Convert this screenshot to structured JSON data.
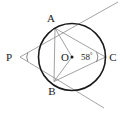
{
  "figure": {
    "type": "circle-tangent-geometry-diagram",
    "background_color": "#ffffff",
    "circle_stroke_color": "#1a1a1a",
    "chord_stroke_color": "#8a8a8a",
    "tangent_stroke_color": "#9a9a9a",
    "label_color": "#1a1a1a"
  },
  "labels": {
    "center": "O",
    "point_a": "A",
    "point_b": "B",
    "point_c": "C",
    "point_p": "P",
    "angle_value": "58",
    "degree_symbol": "°"
  },
  "chart_data": {
    "type": "scatter",
    "title": "",
    "xlabel": "",
    "ylabel": "",
    "xlim": [
      0,
      123
    ],
    "ylim": [
      0,
      114
    ],
    "grid": false,
    "legend": null,
    "circle": {
      "cx": 72,
      "cy": 57,
      "r": 33.5
    },
    "points": [
      {
        "name": "O",
        "x": 72,
        "y": 57,
        "on_circle": false,
        "marker": "dot"
      },
      {
        "name": "A",
        "x": 55.0,
        "y": 28.2,
        "on_circle": true,
        "marker": "none"
      },
      {
        "name": "B",
        "x": 54.0,
        "y": 81.5,
        "on_circle": true,
        "marker": "none"
      },
      {
        "name": "C",
        "x": 105.5,
        "y": 57.0,
        "on_circle": true,
        "marker": "none"
      },
      {
        "name": "P",
        "x": 20.0,
        "y": 57.0,
        "on_circle": false,
        "marker": "none"
      }
    ],
    "segments": [
      {
        "from": "P",
        "to": "A",
        "kind": "tangent"
      },
      {
        "from": "P",
        "to": "B",
        "kind": "tangent"
      },
      {
        "from": "O",
        "to": "A",
        "kind": "radius"
      },
      {
        "from": "O",
        "to": "B",
        "kind": "radius"
      },
      {
        "from": "A",
        "to": "B",
        "kind": "chord"
      },
      {
        "from": "A",
        "to": "C",
        "kind": "chord"
      },
      {
        "from": "B",
        "to": "C",
        "kind": "chord"
      }
    ],
    "rays": [
      {
        "through": "A",
        "from": "P",
        "extends_to": [
          118,
          2
        ],
        "kind": "tangent-extension"
      },
      {
        "through": "B",
        "from": "P",
        "extends_to": [
          104,
          108
        ],
        "kind": "tangent-extension"
      }
    ],
    "angles": [
      {
        "vertex": "C",
        "value": 58,
        "unit": "degrees",
        "label": "58°",
        "arc": true
      },
      {
        "vertex": "P",
        "value": null,
        "unit": "degrees",
        "label": "",
        "arc": true
      }
    ]
  }
}
